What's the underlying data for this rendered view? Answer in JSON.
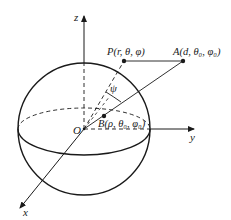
{
  "figure": {
    "colors": {
      "stroke": "#1a1a1a",
      "axis": "#333333",
      "background": "#ffffff"
    },
    "axes": {
      "z": {
        "label": "z"
      },
      "y": {
        "label": "y"
      },
      "x": {
        "label": "x"
      },
      "origin": {
        "label": "O"
      }
    },
    "points": {
      "P": {
        "label": "P(r, θ, φ)"
      },
      "A": {
        "label": "A(d, θ₀, φ₀)"
      },
      "B": {
        "label": "B(ρ, θ₀, φ₀)"
      }
    },
    "angle": {
      "label": "ψ"
    }
  }
}
